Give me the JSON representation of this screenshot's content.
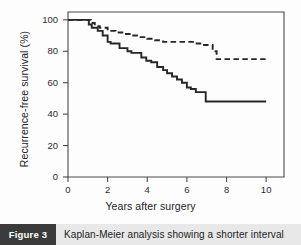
{
  "figure": {
    "tag_label": "Figure 3",
    "caption": "Kaplan-Meier analysis showing a shorter interval",
    "tag_bg_color": "#3b3b3b",
    "caption_bg_color": "#e8e8e8"
  },
  "chart_data": {
    "type": "line",
    "title": "",
    "xlabel": "Years after surgery",
    "ylabel": "Recurrence-free survival (%)",
    "xlim": [
      0,
      10.9
    ],
    "ylim": [
      0,
      105
    ],
    "xticks": [
      0,
      2,
      4,
      6,
      8,
      10
    ],
    "xtick_labels": [
      "0",
      "2",
      "4",
      "6",
      "8",
      "10"
    ],
    "yticks": [
      0,
      20,
      40,
      60,
      80,
      100
    ],
    "ytick_labels": [
      "0",
      "20",
      "40",
      "60",
      "80",
      "100"
    ],
    "grid": false,
    "legend": "none",
    "line_color": "#262626",
    "series": [
      {
        "name": "solid-curve",
        "style": "solid",
        "step": "post",
        "x": [
          0.0,
          0.9,
          1.05,
          1.2,
          1.5,
          1.75,
          2.0,
          2.15,
          2.35,
          2.6,
          3.0,
          3.2,
          3.45,
          3.7,
          3.95,
          4.2,
          4.5,
          4.8,
          5.0,
          5.25,
          5.5,
          5.75,
          6.0,
          6.2,
          6.45,
          6.7,
          6.95,
          7.0,
          10.0
        ],
        "y": [
          100,
          100,
          97,
          95,
          93,
          90,
          86,
          85,
          85,
          82,
          80,
          79,
          79,
          76,
          74,
          73,
          70,
          68,
          66,
          64,
          62,
          60,
          57,
          56,
          54,
          54,
          48,
          48,
          48
        ]
      },
      {
        "name": "dashed-curve",
        "style": "dashed",
        "step": "post",
        "x": [
          0.0,
          0.95,
          1.15,
          1.35,
          1.6,
          2.0,
          2.4,
          2.8,
          3.2,
          3.6,
          4.0,
          4.4,
          4.8,
          5.2,
          5.6,
          6.0,
          6.4,
          6.8,
          7.1,
          7.3,
          7.5,
          10.0
        ],
        "y": [
          100,
          100,
          98,
          96,
          95,
          93,
          92,
          91,
          90,
          89,
          88,
          87,
          86,
          86,
          86,
          86,
          85,
          84,
          84,
          80,
          75,
          75
        ]
      }
    ]
  }
}
